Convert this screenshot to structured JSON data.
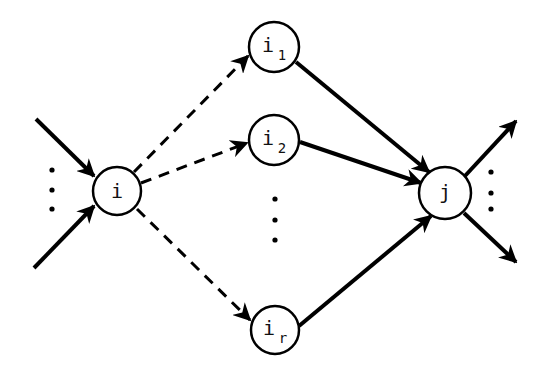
{
  "diagram": {
    "type": "directed-graph",
    "nodes": [
      {
        "id": "i",
        "label": "i",
        "sub": ""
      },
      {
        "id": "i1",
        "label": "i",
        "sub": "1"
      },
      {
        "id": "i2",
        "label": "i",
        "sub": "2"
      },
      {
        "id": "ir",
        "label": "i",
        "sub": "r"
      },
      {
        "id": "j",
        "label": "j",
        "sub": ""
      }
    ],
    "edges": [
      {
        "from": "in-top",
        "to": "i",
        "style": "solid"
      },
      {
        "from": "in-bottom",
        "to": "i",
        "style": "solid"
      },
      {
        "from": "i",
        "to": "i1",
        "style": "dashed"
      },
      {
        "from": "i",
        "to": "i2",
        "style": "dashed"
      },
      {
        "from": "i",
        "to": "ir",
        "style": "dashed"
      },
      {
        "from": "i1",
        "to": "j",
        "style": "solid"
      },
      {
        "from": "i2",
        "to": "j",
        "style": "solid"
      },
      {
        "from": "ir",
        "to": "j",
        "style": "solid"
      },
      {
        "from": "j",
        "to": "out-top",
        "style": "solid"
      },
      {
        "from": "j",
        "to": "out-bottom",
        "style": "solid"
      }
    ],
    "ellipses": [
      "left-of-i",
      "between-i2-and-ir",
      "right-of-j"
    ]
  }
}
